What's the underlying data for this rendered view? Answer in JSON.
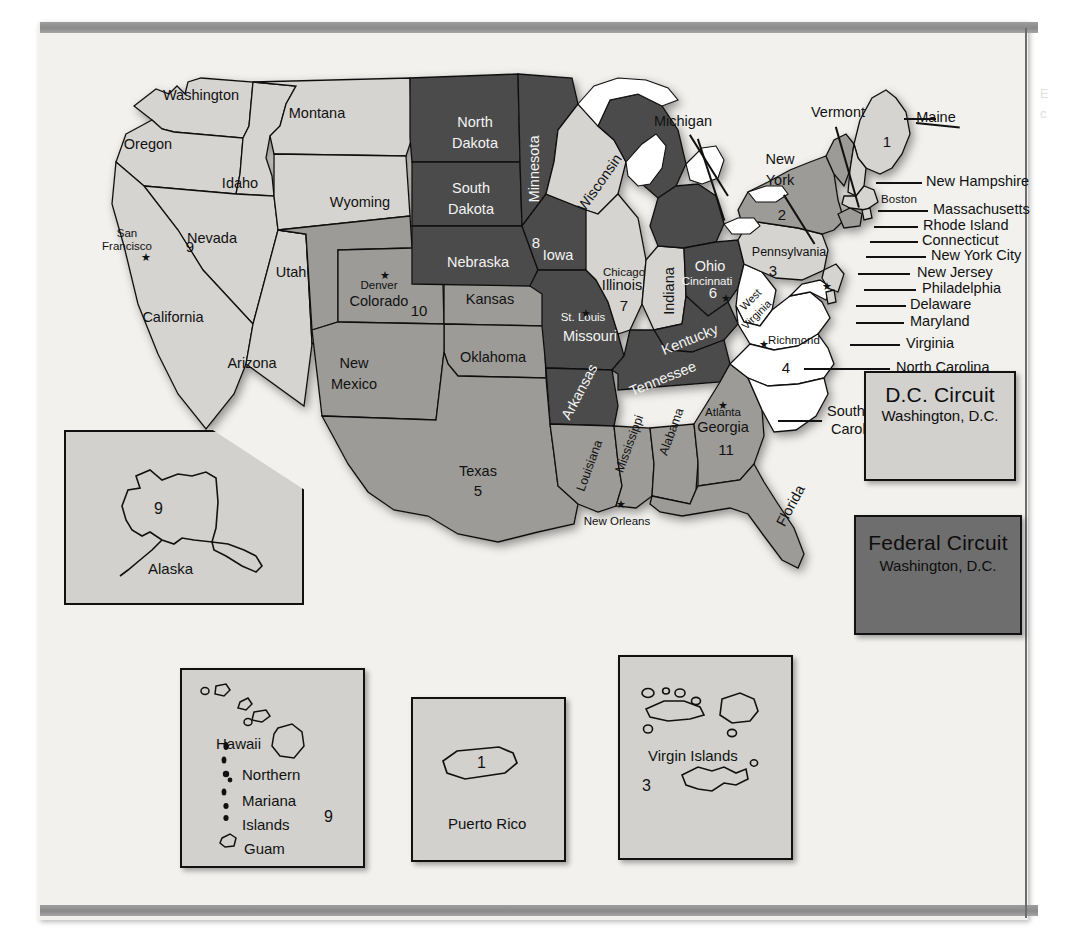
{
  "page": {
    "background_color": "#f2f1ee",
    "rule_color": "#8f8f8f"
  },
  "map": {
    "title": "United States Federal Judicial Circuits",
    "shading": {
      "white": "#ffffff",
      "light": "#d5d4d0",
      "medium": "#9c9b97",
      "dark": "#4b4b4b",
      "lake": "#ffffff",
      "outline": "#111111"
    },
    "states": [
      {
        "name": "Washington",
        "circuit": 9,
        "tone": "light"
      },
      {
        "name": "Oregon",
        "circuit": 9,
        "tone": "light"
      },
      {
        "name": "Idaho",
        "circuit": 9,
        "tone": "light"
      },
      {
        "name": "Montana",
        "circuit": 9,
        "tone": "light"
      },
      {
        "name": "Nevada",
        "circuit": 9,
        "tone": "light"
      },
      {
        "name": "California",
        "circuit": 9,
        "tone": "light"
      },
      {
        "name": "Arizona",
        "circuit": 9,
        "tone": "light"
      },
      {
        "name": "Wyoming",
        "circuit": 10,
        "tone": "light"
      },
      {
        "name": "Utah",
        "circuit": 10,
        "tone": "medium"
      },
      {
        "name": "Colorado",
        "circuit": 10,
        "tone": "medium"
      },
      {
        "name": "Kansas",
        "circuit": 10,
        "tone": "medium"
      },
      {
        "name": "Oklahoma",
        "circuit": 10,
        "tone": "medium"
      },
      {
        "name": "New Mexico",
        "circuit": 10,
        "tone": "medium"
      },
      {
        "name": "North Dakota",
        "circuit": 8,
        "tone": "dark"
      },
      {
        "name": "South Dakota",
        "circuit": 8,
        "tone": "dark"
      },
      {
        "name": "Nebraska",
        "circuit": 8,
        "tone": "dark"
      },
      {
        "name": "Minnesota",
        "circuit": 8,
        "tone": "dark"
      },
      {
        "name": "Iowa",
        "circuit": 8,
        "tone": "dark"
      },
      {
        "name": "Missouri",
        "circuit": 8,
        "tone": "dark"
      },
      {
        "name": "Arkansas",
        "circuit": 8,
        "tone": "dark"
      },
      {
        "name": "Wisconsin",
        "circuit": 7,
        "tone": "light"
      },
      {
        "name": "Illinois",
        "circuit": 7,
        "tone": "light"
      },
      {
        "name": "Indiana",
        "circuit": 7,
        "tone": "light"
      },
      {
        "name": "Michigan",
        "circuit": 6,
        "tone": "dark"
      },
      {
        "name": "Ohio",
        "circuit": 6,
        "tone": "dark"
      },
      {
        "name": "Kentucky",
        "circuit": 6,
        "tone": "dark"
      },
      {
        "name": "Tennessee",
        "circuit": 6,
        "tone": "dark"
      },
      {
        "name": "Texas",
        "circuit": 5,
        "tone": "medium"
      },
      {
        "name": "Louisiana",
        "circuit": 5,
        "tone": "medium"
      },
      {
        "name": "Mississippi",
        "circuit": 5,
        "tone": "medium"
      },
      {
        "name": "Alabama",
        "circuit": 11,
        "tone": "medium"
      },
      {
        "name": "Georgia",
        "circuit": 11,
        "tone": "medium"
      },
      {
        "name": "Florida",
        "circuit": 11,
        "tone": "medium"
      },
      {
        "name": "West Virginia",
        "circuit": 4,
        "tone": "white"
      },
      {
        "name": "Virginia",
        "circuit": 4,
        "tone": "white"
      },
      {
        "name": "Maryland",
        "circuit": 4,
        "tone": "white"
      },
      {
        "name": "North Carolina",
        "circuit": 4,
        "tone": "white"
      },
      {
        "name": "South Carolina",
        "circuit": 4,
        "tone": "white"
      },
      {
        "name": "Pennsylvania",
        "circuit": 3,
        "tone": "light"
      },
      {
        "name": "New Jersey",
        "circuit": 3,
        "tone": "light"
      },
      {
        "name": "Delaware",
        "circuit": 3,
        "tone": "light"
      },
      {
        "name": "New York",
        "circuit": 2,
        "tone": "medium"
      },
      {
        "name": "Vermont",
        "circuit": 2,
        "tone": "medium"
      },
      {
        "name": "Connecticut",
        "circuit": 2,
        "tone": "medium"
      },
      {
        "name": "Maine",
        "circuit": 1,
        "tone": "light"
      },
      {
        "name": "New Hampshire",
        "circuit": 1,
        "tone": "light"
      },
      {
        "name": "Massachusetts",
        "circuit": 1,
        "tone": "light"
      },
      {
        "name": "Rhode Island",
        "circuit": 1,
        "tone": "light"
      }
    ],
    "state_labels": [
      {
        "text": "Washington",
        "x": 163,
        "y": 62,
        "cls": "st"
      },
      {
        "text": "Montana",
        "x": 279,
        "y": 80,
        "cls": "st"
      },
      {
        "text": "Oregon",
        "x": 110,
        "y": 111,
        "cls": "st"
      },
      {
        "text": "Idaho",
        "x": 202,
        "y": 150,
        "cls": "st"
      },
      {
        "text": "Wyoming",
        "x": 322,
        "y": 169,
        "cls": "st"
      },
      {
        "text": "Nevada",
        "x": 174,
        "y": 205,
        "cls": "st"
      },
      {
        "text": "Utah",
        "x": 253,
        "y": 239,
        "cls": "st"
      },
      {
        "text": "Colorado",
        "x": 341,
        "y": 268,
        "cls": "st"
      },
      {
        "text": "Kansas",
        "x": 452,
        "y": 266,
        "cls": "st"
      },
      {
        "text": "California",
        "x": 135,
        "y": 284,
        "cls": "st"
      },
      {
        "text": "Arizona",
        "x": 214,
        "y": 330,
        "cls": "st"
      },
      {
        "text": "New",
        "x": 316,
        "y": 330,
        "cls": "st"
      },
      {
        "text": "Mexico",
        "x": 316,
        "y": 351,
        "cls": "st"
      },
      {
        "text": "Oklahoma",
        "x": 455,
        "y": 324,
        "cls": "st"
      },
      {
        "text": "Texas",
        "x": 440,
        "y": 438,
        "cls": "st"
      },
      {
        "text": "North",
        "x": 437,
        "y": 89,
        "cls": "st white-txt"
      },
      {
        "text": "Dakota",
        "x": 437,
        "y": 110,
        "cls": "st white-txt"
      },
      {
        "text": "South",
        "x": 433,
        "y": 155,
        "cls": "st white-txt"
      },
      {
        "text": "Dakota",
        "x": 433,
        "y": 176,
        "cls": "st white-txt"
      },
      {
        "text": "Nebraska",
        "x": 440,
        "y": 229,
        "cls": "st white-txt"
      },
      {
        "text": "Minnesota",
        "x": 497,
        "y": 135,
        "cls": "st white-txt rot-90"
      },
      {
        "text": "Iowa",
        "x": 520,
        "y": 222,
        "cls": "st white-txt"
      },
      {
        "text": "Missouri",
        "x": 552,
        "y": 303,
        "cls": "st white-txt"
      },
      {
        "text": "Arkansas",
        "x": 542,
        "y": 358,
        "cls": "st white-txt rot-60"
      },
      {
        "text": "Wisconsin",
        "x": 562,
        "y": 149,
        "cls": "st rot-55"
      },
      {
        "text": "Illinois",
        "x": 584,
        "y": 252,
        "cls": "st"
      },
      {
        "text": "Indiana",
        "x": 632,
        "y": 257,
        "cls": "st rot-90"
      },
      {
        "text": "Michigan",
        "x": 645,
        "y": 88,
        "cls": "st"
      },
      {
        "text": "Ohio",
        "x": 672,
        "y": 233,
        "cls": "st white-txt"
      },
      {
        "text": "Kentucky",
        "x": 652,
        "y": 306,
        "cls": "st white-txt rot-25"
      },
      {
        "text": "Tennessee",
        "x": 625,
        "y": 345,
        "cls": "st white-txt rot-25"
      },
      {
        "text": "Mississippi",
        "x": 592,
        "y": 410,
        "cls": "st-sm rot-70"
      },
      {
        "text": "Louisiana",
        "x": 552,
        "y": 432,
        "cls": "st-sm rot-70"
      },
      {
        "text": "Alabama",
        "x": 634,
        "y": 398,
        "cls": "st-sm rot-70"
      },
      {
        "text": "Georgia",
        "x": 685,
        "y": 394,
        "cls": "st"
      },
      {
        "text": "Florida",
        "x": 753,
        "y": 472,
        "cls": "st rot-60"
      },
      {
        "text": "West",
        "x": 713,
        "y": 266,
        "cls": "st-xs rot-45"
      },
      {
        "text": "Virginia",
        "x": 719,
        "y": 281,
        "cls": "st-xs rot-45"
      },
      {
        "text": "Pennsylvania",
        "x": 751,
        "y": 219,
        "cls": "st-sm"
      },
      {
        "text": "New",
        "x": 742,
        "y": 126,
        "cls": "st"
      },
      {
        "text": "York",
        "x": 742,
        "y": 147,
        "cls": "st"
      },
      {
        "text": "Vermont",
        "x": 800,
        "y": 79,
        "cls": "st"
      },
      {
        "text": "Maine",
        "x": 898,
        "y": 84,
        "cls": "st"
      }
    ],
    "circuit_numbers": [
      {
        "n": "9",
        "x": 152,
        "y": 213,
        "cls": "num"
      },
      {
        "n": "10",
        "x": 381,
        "y": 277,
        "cls": "num"
      },
      {
        "n": "8",
        "x": 498,
        "y": 209,
        "cls": "num white-txt"
      },
      {
        "n": "7",
        "x": 586,
        "y": 272,
        "cls": "num"
      },
      {
        "n": "6",
        "x": 675,
        "y": 259,
        "cls": "num white-txt"
      },
      {
        "n": "5",
        "x": 440,
        "y": 457,
        "cls": "num"
      },
      {
        "n": "11",
        "x": 688,
        "y": 416,
        "cls": "num"
      },
      {
        "n": "4",
        "x": 748,
        "y": 334,
        "cls": "num"
      },
      {
        "n": "3",
        "x": 735,
        "y": 237,
        "cls": "num"
      },
      {
        "n": "2",
        "x": 744,
        "y": 181,
        "cls": "num"
      },
      {
        "n": "1",
        "x": 849,
        "y": 108,
        "cls": "num"
      }
    ],
    "cities": [
      {
        "name": "San",
        "x": 89,
        "y": 199,
        "cls": "city"
      },
      {
        "name": "Francisco",
        "x": 89,
        "y": 212,
        "cls": "city"
      },
      {
        "name": "Denver",
        "x": 341,
        "y": 251,
        "cls": "city"
      },
      {
        "name": "Chicago",
        "x": 586,
        "y": 238,
        "cls": "city"
      },
      {
        "name": "St. Louis",
        "x": 545,
        "y": 283,
        "cls": "city white-txt"
      },
      {
        "name": "Cincinnati",
        "x": 669,
        "y": 247,
        "cls": "city white-txt"
      },
      {
        "name": "Richmond",
        "x": 756,
        "y": 306,
        "cls": "city"
      },
      {
        "name": "Atlanta",
        "x": 685,
        "y": 378,
        "cls": "city"
      },
      {
        "name": "Boston",
        "x": 861,
        "y": 165,
        "cls": "city"
      },
      {
        "name": "New Orleans",
        "x": 579,
        "y": 487,
        "cls": "city"
      }
    ],
    "city_stars": [
      {
        "x": 103,
        "y": 218
      },
      {
        "x": 342,
        "y": 236
      },
      {
        "x": 543,
        "y": 274
      },
      {
        "x": 683,
        "y": 259
      },
      {
        "x": 721,
        "y": 305
      },
      {
        "x": 680,
        "y": 366
      },
      {
        "x": 578,
        "y": 465
      },
      {
        "x": 784,
        "y": 247
      }
    ],
    "callouts": [
      {
        "text": "New Hampshire",
        "x": 888,
        "y": 148
      },
      {
        "text": "Massachusetts",
        "x": 895,
        "y": 176
      },
      {
        "text": "Rhode Island",
        "x": 885,
        "y": 192
      },
      {
        "text": "Connecticut",
        "x": 884,
        "y": 207
      },
      {
        "text": "New York City",
        "x": 893,
        "y": 222
      },
      {
        "text": "New Jersey",
        "x": 879,
        "y": 239
      },
      {
        "text": "Philadelphia",
        "x": 884,
        "y": 255
      },
      {
        "text": "Delaware",
        "x": 872,
        "y": 271
      },
      {
        "text": "Maryland",
        "x": 872,
        "y": 288
      },
      {
        "text": "Virginia",
        "x": 868,
        "y": 310
      },
      {
        "text": "North Carolina",
        "x": 858,
        "y": 334
      },
      {
        "text": "South",
        "x": 789,
        "y": 378
      },
      {
        "text": "Carolina",
        "x": 793,
        "y": 396
      }
    ]
  },
  "insets": {
    "alaska": {
      "name": "Alaska",
      "circuit": "9",
      "tone": "light"
    },
    "pacific": {
      "labels": [
        "Hawaii",
        "Northern",
        "Mariana",
        "Islands",
        "Guam"
      ],
      "circuit": "9",
      "tone": "light"
    },
    "puerto_rico": {
      "name": "Puerto Rico",
      "circuit": "1",
      "tone": "light"
    },
    "virgin_islands": {
      "name": "Virgin Islands",
      "circuit": "3",
      "tone": "light"
    }
  },
  "circuit_boxes": [
    {
      "id": "dc",
      "title": "D.C. Circuit",
      "subtitle": "Washington, D.C.",
      "tone": "light",
      "fill": "#d2d1cd"
    },
    {
      "id": "federal",
      "title": "Federal Circuit",
      "subtitle": "Washington, D.C.",
      "tone": "dark",
      "fill": "#6e6e6e"
    }
  ],
  "ghost_text": {
    "line1": "E",
    "line2": "c"
  }
}
